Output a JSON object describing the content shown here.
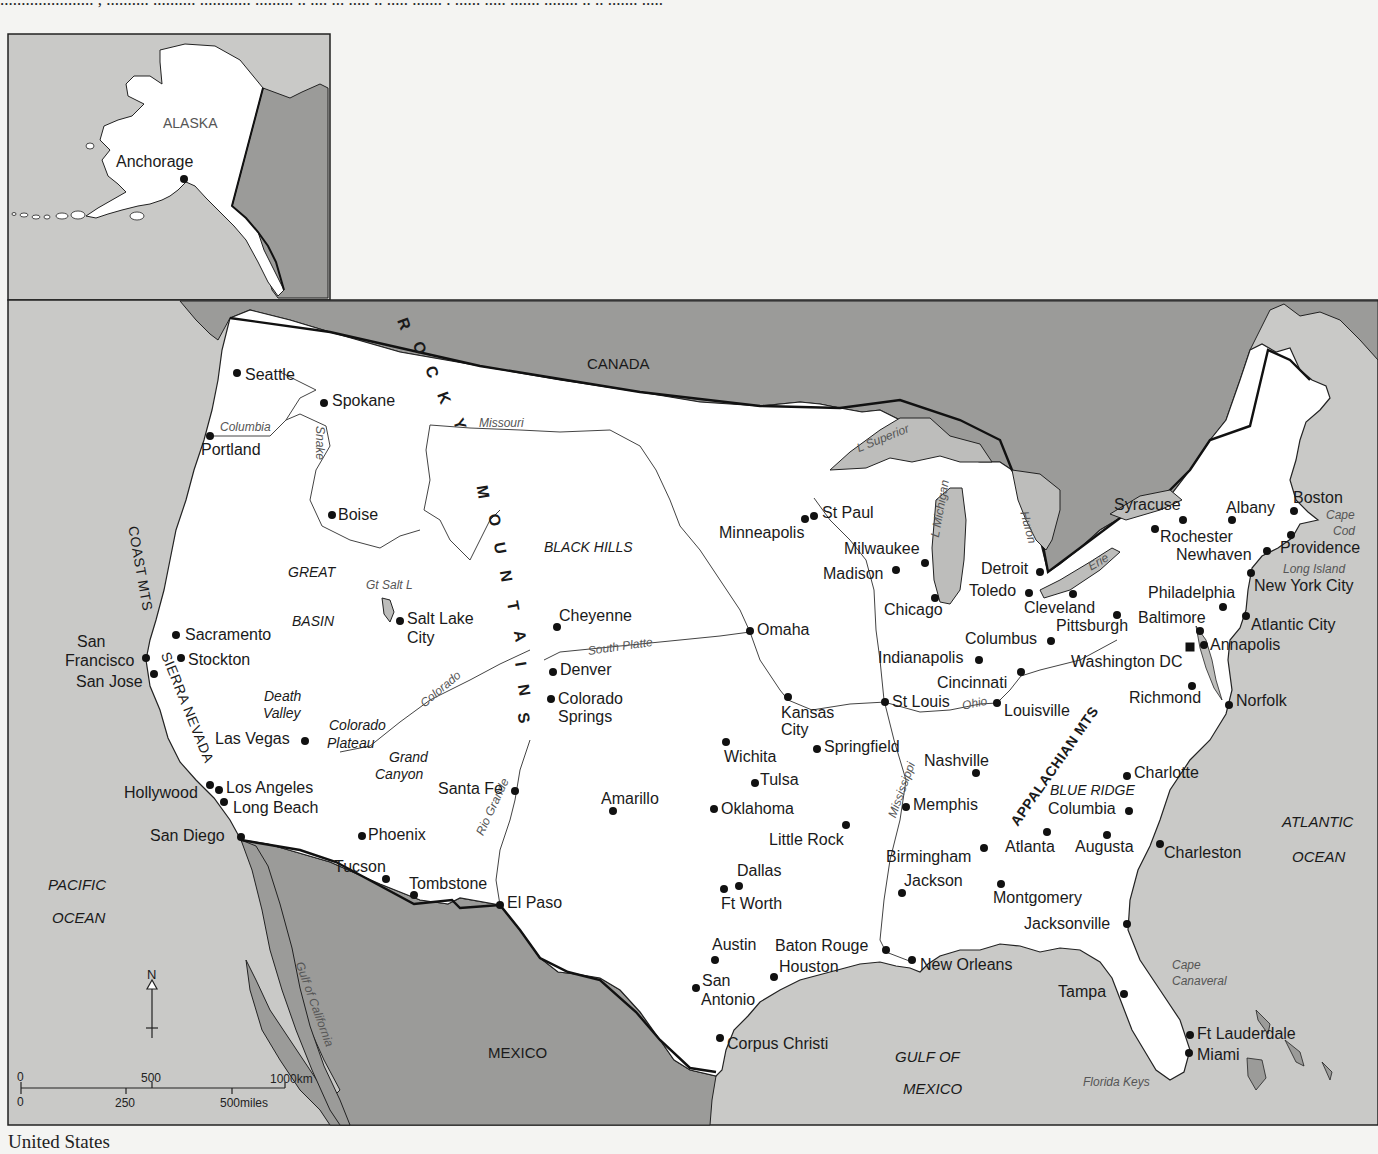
{
  "page": {
    "top_text_fragment": "...................... , .......... .......... ............ ......... .. .... ... ..... .. ..... ....... . ...... ..... ....... ........ .. .. ....... .....",
    "caption": "United States"
  },
  "colors": {
    "ocean": "#c9c9c7",
    "foreign_land": "#9b9b99",
    "us_land": "#ffffff",
    "lake": "#bdbdbb",
    "border": "#111111",
    "river": "#555555"
  },
  "inset": {
    "title": "ALASKA",
    "cities": [
      {
        "name": "Anchorage",
        "x": 184,
        "y": 179,
        "lx": 116,
        "ly": 154
      }
    ]
  },
  "countries": [
    {
      "name": "CANADA",
      "x": 587,
      "y": 356
    },
    {
      "name": "MEXICO",
      "x": 488,
      "y": 1045
    }
  ],
  "oceans": [
    {
      "name": "PACIFIC",
      "x": 48,
      "y": 877
    },
    {
      "name": "OCEAN",
      "x": 52,
      "y": 910
    },
    {
      "name": "ATLANTIC",
      "x": 1282,
      "y": 814
    },
    {
      "name": "OCEAN",
      "x": 1292,
      "y": 849
    },
    {
      "name": "GULF OF",
      "x": 895,
      "y": 1049
    },
    {
      "name": "MEXICO",
      "x": 903,
      "y": 1081
    }
  ],
  "mountains": {
    "rocky": {
      "letters": [
        "R",
        "O",
        "C",
        "K",
        "Y",
        "M",
        "O",
        "U",
        "N",
        "T",
        "A",
        "I",
        "N",
        "S"
      ]
    },
    "coast_mts": "COAST MTS",
    "sierra_nevada": "SIERRA NEVADA",
    "appalachian": "APPALACHIAN MTS"
  },
  "regions": [
    {
      "name": "GREAT",
      "x": 288,
      "y": 565
    },
    {
      "name": "BASIN",
      "x": 292,
      "y": 614
    },
    {
      "name": "BLACK HILLS",
      "x": 544,
      "y": 540
    },
    {
      "name": "Death",
      "x": 264,
      "y": 689
    },
    {
      "name": "Valley",
      "x": 263,
      "y": 706
    },
    {
      "name": "Colorado",
      "x": 329,
      "y": 718
    },
    {
      "name": "Plateau",
      "x": 327,
      "y": 736
    },
    {
      "name": "Grand",
      "x": 389,
      "y": 750
    },
    {
      "name": "Canyon",
      "x": 375,
      "y": 767
    },
    {
      "name": "BLUE RIDGE",
      "x": 1050,
      "y": 783
    }
  ],
  "water_features": [
    {
      "name": "Columbia",
      "x": 220,
      "y": 421,
      "rot": 0
    },
    {
      "name": "Snake",
      "x": 326,
      "y": 426,
      "rot": 90
    },
    {
      "name": "Missouri",
      "x": 479,
      "y": 417,
      "rot": 0
    },
    {
      "name": "Gt Salt L",
      "x": 366,
      "y": 579,
      "rot": 0
    },
    {
      "name": "South Platte",
      "x": 587,
      "y": 645,
      "rot": -8
    },
    {
      "name": "Colorado",
      "x": 418,
      "y": 700,
      "rot": -40
    },
    {
      "name": "Rio Grande",
      "x": 474,
      "y": 832,
      "rot": -65
    },
    {
      "name": "Gulf of California",
      "x": 305,
      "y": 960,
      "rot": 70
    },
    {
      "name": "L Superior",
      "x": 855,
      "y": 443,
      "rot": -22
    },
    {
      "name": "L Michigan",
      "x": 929,
      "y": 536,
      "rot": -80
    },
    {
      "name": "Huron",
      "x": 1030,
      "y": 510,
      "rot": 75
    },
    {
      "name": "Erie",
      "x": 1086,
      "y": 562,
      "rot": -30
    },
    {
      "name": "Ohio",
      "x": 961,
      "y": 700,
      "rot": -12
    },
    {
      "name": "Mississippi",
      "x": 886,
      "y": 815,
      "rot": -70
    },
    {
      "name": "Cape",
      "x": 1326,
      "y": 509,
      "rot": 0
    },
    {
      "name": "Cod",
      "x": 1333,
      "y": 525,
      "rot": 0
    },
    {
      "name": "Long Island",
      "x": 1283,
      "y": 563,
      "rot": 0
    },
    {
      "name": "Cape",
      "x": 1172,
      "y": 959,
      "rot": 0
    },
    {
      "name": "Canaveral",
      "x": 1172,
      "y": 975,
      "rot": 0
    },
    {
      "name": "Florida Keys",
      "x": 1083,
      "y": 1076,
      "rot": 0
    }
  ],
  "cities": [
    {
      "name": "Seattle",
      "x": 237,
      "y": 373,
      "lx": 245,
      "ly": 367
    },
    {
      "name": "Spokane",
      "x": 324,
      "y": 403,
      "lx": 332,
      "ly": 393
    },
    {
      "name": "Portland",
      "x": 210,
      "y": 436,
      "lx": 201,
      "ly": 442
    },
    {
      "name": "Boise",
      "x": 332,
      "y": 515,
      "lx": 338,
      "ly": 507
    },
    {
      "name": "Salt Lake",
      "x": 400,
      "y": 621,
      "lx": 407,
      "ly": 611
    },
    {
      "name": "City",
      "x": null,
      "y": null,
      "lx": 407,
      "ly": 630
    },
    {
      "name": "Sacramento",
      "x": 176,
      "y": 635,
      "lx": 185,
      "ly": 627
    },
    {
      "name": "San",
      "x": null,
      "y": null,
      "lx": 77,
      "ly": 634
    },
    {
      "name": "Francisco",
      "x": 146,
      "y": 658,
      "lx": 65,
      "ly": 653
    },
    {
      "name": "Stockton",
      "x": 181,
      "y": 658,
      "lx": 188,
      "ly": 652
    },
    {
      "name": "San Jose",
      "x": 154,
      "y": 674,
      "lx": 76,
      "ly": 674
    },
    {
      "name": "Las Vegas",
      "x": 305,
      "y": 741,
      "lx": 215,
      "ly": 731
    },
    {
      "name": "Los Angeles",
      "x": 219,
      "y": 790,
      "lx": 226,
      "ly": 780
    },
    {
      "name": "Hollywood",
      "x": 210,
      "y": 785,
      "lx": 124,
      "ly": 785
    },
    {
      "name": "Long Beach",
      "x": 224,
      "y": 802,
      "lx": 233,
      "ly": 800
    },
    {
      "name": "San Diego",
      "x": 241,
      "y": 837,
      "lx": 150,
      "ly": 828
    },
    {
      "name": "Phoenix",
      "x": 362,
      "y": 836,
      "lx": 368,
      "ly": 827
    },
    {
      "name": "Tucson",
      "x": 386,
      "y": 879,
      "lx": 334,
      "ly": 859
    },
    {
      "name": "Tombstone",
      "x": 414,
      "y": 895,
      "lx": 409,
      "ly": 876
    },
    {
      "name": "El Paso",
      "x": 500,
      "y": 905,
      "lx": 507,
      "ly": 895
    },
    {
      "name": "Santa Fe",
      "x": 515,
      "y": 791,
      "lx": 438,
      "ly": 781
    },
    {
      "name": "Cheyenne",
      "x": 557,
      "y": 627,
      "lx": 559,
      "ly": 608
    },
    {
      "name": "Denver",
      "x": 553,
      "y": 672,
      "lx": 560,
      "ly": 662
    },
    {
      "name": "Colorado",
      "x": 551,
      "y": 699,
      "lx": 558,
      "ly": 691
    },
    {
      "name": "Springs",
      "x": null,
      "y": null,
      "lx": 558,
      "ly": 709
    },
    {
      "name": "Amarillo",
      "x": 613,
      "y": 811,
      "lx": 601,
      "ly": 791
    },
    {
      "name": "Minneapolis",
      "x": 805,
      "y": 519,
      "lx": 719,
      "ly": 525
    },
    {
      "name": "St Paul",
      "x": 814,
      "y": 516,
      "lx": 822,
      "ly": 505
    },
    {
      "name": "Omaha",
      "x": 750,
      "y": 631,
      "lx": 757,
      "ly": 622
    },
    {
      "name": "Kansas",
      "x": 788,
      "y": 697,
      "lx": 781,
      "ly": 705
    },
    {
      "name": "City",
      "x": null,
      "y": null,
      "lx": 781,
      "ly": 722
    },
    {
      "name": "Wichita",
      "x": 726,
      "y": 742,
      "lx": 724,
      "ly": 749
    },
    {
      "name": "Springfield",
      "x": 817,
      "y": 749,
      "lx": 824,
      "ly": 739
    },
    {
      "name": "Tulsa",
      "x": 755,
      "y": 783,
      "lx": 760,
      "ly": 772
    },
    {
      "name": "Oklahoma",
      "x": 714,
      "y": 809,
      "lx": 721,
      "ly": 801
    },
    {
      "name": "Little Rock",
      "x": 846,
      "y": 825,
      "lx": 769,
      "ly": 832
    },
    {
      "name": "Dallas",
      "x": 739,
      "y": 886,
      "lx": 737,
      "ly": 863
    },
    {
      "name": "Ft Worth",
      "x": 724,
      "y": 889,
      "lx": 721,
      "ly": 896
    },
    {
      "name": "Austin",
      "x": 715,
      "y": 960,
      "lx": 712,
      "ly": 937
    },
    {
      "name": "San",
      "x": 696,
      "y": 988,
      "lx": 702,
      "ly": 973
    },
    {
      "name": "Antonio",
      "x": null,
      "y": null,
      "lx": 701,
      "ly": 992
    },
    {
      "name": "Houston",
      "x": 774,
      "y": 977,
      "lx": 779,
      "ly": 959
    },
    {
      "name": "Baton Rouge",
      "x": 886,
      "y": 950,
      "lx": 775,
      "ly": 938
    },
    {
      "name": "Corpus Christi",
      "x": 720,
      "y": 1038,
      "lx": 727,
      "ly": 1036
    },
    {
      "name": "New Orleans",
      "x": 912,
      "y": 960,
      "lx": 920,
      "ly": 957
    },
    {
      "name": "Milwaukee",
      "x": 925,
      "y": 563,
      "lx": 844,
      "ly": 541
    },
    {
      "name": "Madison",
      "x": 896,
      "y": 570,
      "lx": 823,
      "ly": 566
    },
    {
      "name": "Chicago",
      "x": 935,
      "y": 598,
      "lx": 884,
      "ly": 602
    },
    {
      "name": "Detroit",
      "x": 1040,
      "y": 572,
      "lx": 981,
      "ly": 561
    },
    {
      "name": "Toledo",
      "x": 1029,
      "y": 593,
      "lx": 969,
      "ly": 583
    },
    {
      "name": "Cleveland",
      "x": 1073,
      "y": 594,
      "lx": 1024,
      "ly": 600
    },
    {
      "name": "Pittsburgh",
      "x": 1117,
      "y": 615,
      "lx": 1056,
      "ly": 618
    },
    {
      "name": "Columbus",
      "x": 1051,
      "y": 641,
      "lx": 965,
      "ly": 631
    },
    {
      "name": "Indianapolis",
      "x": 979,
      "y": 660,
      "lx": 878,
      "ly": 650
    },
    {
      "name": "Cincinnati",
      "x": 1021,
      "y": 672,
      "lx": 937,
      "ly": 675
    },
    {
      "name": "St Louis",
      "x": 885,
      "y": 702,
      "lx": 892,
      "ly": 694
    },
    {
      "name": "Louisville",
      "x": 997,
      "y": 703,
      "lx": 1004,
      "ly": 703
    },
    {
      "name": "Nashville",
      "x": 976,
      "y": 773,
      "lx": 924,
      "ly": 753
    },
    {
      "name": "Memphis",
      "x": 906,
      "y": 807,
      "lx": 913,
      "ly": 797
    },
    {
      "name": "Birmingham",
      "x": 984,
      "y": 848,
      "lx": 886,
      "ly": 849
    },
    {
      "name": "Atlanta",
      "x": 1047,
      "y": 832,
      "lx": 1005,
      "ly": 839
    },
    {
      "name": "Augusta",
      "x": 1107,
      "y": 835,
      "lx": 1075,
      "ly": 839
    },
    {
      "name": "Charlotte",
      "x": 1127,
      "y": 776,
      "lx": 1134,
      "ly": 765
    },
    {
      "name": "Columbia",
      "x": 1129,
      "y": 811,
      "lx": 1048,
      "ly": 801
    },
    {
      "name": "Charleston",
      "x": 1160,
      "y": 844,
      "lx": 1164,
      "ly": 845
    },
    {
      "name": "Jackson",
      "x": 902,
      "y": 893,
      "lx": 904,
      "ly": 873
    },
    {
      "name": "Montgomery",
      "x": 1001,
      "y": 884,
      "lx": 993,
      "ly": 890
    },
    {
      "name": "Jacksonville",
      "x": 1127,
      "y": 924,
      "lx": 1024,
      "ly": 916
    },
    {
      "name": "Tampa",
      "x": 1124,
      "y": 994,
      "lx": 1058,
      "ly": 984
    },
    {
      "name": "Ft Lauderdale",
      "x": 1190,
      "y": 1035,
      "lx": 1197,
      "ly": 1026
    },
    {
      "name": "Miami",
      "x": 1189,
      "y": 1053,
      "lx": 1197,
      "ly": 1047
    },
    {
      "name": "Syracuse",
      "x": 1183,
      "y": 520,
      "lx": 1114,
      "ly": 497
    },
    {
      "name": "Rochester",
      "x": 1155,
      "y": 529,
      "lx": 1160,
      "ly": 529
    },
    {
      "name": "Albany",
      "x": 1232,
      "y": 520,
      "lx": 1226,
      "ly": 500
    },
    {
      "name": "Boston",
      "x": 1294,
      "y": 511,
      "lx": 1293,
      "ly": 490
    },
    {
      "name": "Providence",
      "x": 1291,
      "y": 535,
      "lx": 1280,
      "ly": 540
    },
    {
      "name": "Newhaven",
      "x": 1267,
      "y": 551,
      "lx": 1176,
      "ly": 547
    },
    {
      "name": "New York City",
      "x": 1251,
      "y": 573,
      "lx": 1254,
      "ly": 578
    },
    {
      "name": "Philadelphia",
      "x": 1223,
      "y": 607,
      "lx": 1148,
      "ly": 585
    },
    {
      "name": "Baltimore",
      "x": 1200,
      "y": 631,
      "lx": 1138,
      "ly": 610
    },
    {
      "name": "Atlantic City",
      "x": 1246,
      "y": 616,
      "lx": 1251,
      "ly": 617
    },
    {
      "name": "Annapolis",
      "x": 1204,
      "y": 645,
      "lx": 1210,
      "ly": 637
    },
    {
      "name": "Washington DC",
      "x": 1190,
      "y": 647,
      "lx": 1071,
      "ly": 654,
      "capital": true
    },
    {
      "name": "Richmond",
      "x": 1192,
      "y": 686,
      "lx": 1129,
      "ly": 690
    },
    {
      "name": "Norfolk",
      "x": 1229,
      "y": 705,
      "lx": 1236,
      "ly": 693
    }
  ],
  "compass": {
    "label": "N"
  },
  "scale_bar": {
    "km_labels": [
      "0",
      "500",
      "1000km"
    ],
    "mile_labels": [
      "0",
      "250",
      "500miles"
    ]
  }
}
